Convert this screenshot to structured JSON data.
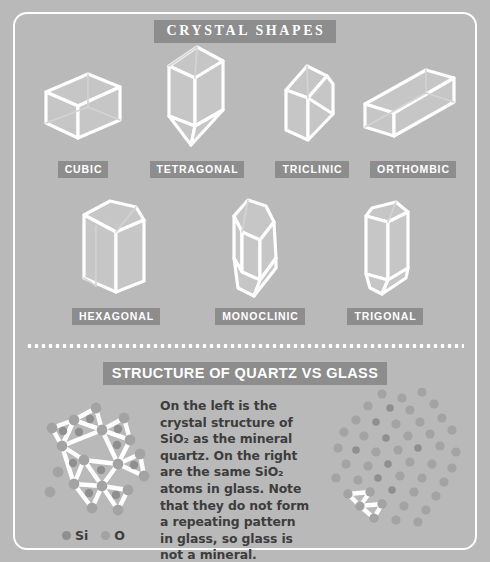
{
  "poster": {
    "background_color": "#b9b9b9",
    "badge_color": "#8d8d8d",
    "outline_color": "#ffffff",
    "text_color": "#3d3d3d"
  },
  "crystal_section": {
    "title": "CRYSTAL SHAPES",
    "shapes": [
      {
        "label": "CUBIC",
        "icon": "cubic-crystal-icon"
      },
      {
        "label": "TETRAGONAL",
        "icon": "tetragonal-crystal-icon"
      },
      {
        "label": "TRICLINIC",
        "icon": "triclinic-crystal-icon"
      },
      {
        "label": "ORTHOMBIC",
        "icon": "orthombic-crystal-icon"
      },
      {
        "label": "HEXAGONAL",
        "icon": "hexagonal-crystal-icon"
      },
      {
        "label": "MONOCLINIC",
        "icon": "monoclinic-crystal-icon"
      },
      {
        "label": "TRIGONAL",
        "icon": "trigonal-crystal-icon"
      }
    ]
  },
  "structure_section": {
    "title": "STRUCTURE OF QUARTZ VS GLASS",
    "body_text": "On the left is the crystal structure of SiO₂ as the mineral quartz. On the right are the same SiO₂ atoms in glass. Note that they do not form a repeating pattern in glass, so glass is not a mineral.",
    "left_diagram": "quartz-crystal-lattice-diagram",
    "right_diagram": "glass-amorphous-structure-diagram",
    "legend": [
      {
        "label": "Si",
        "color": "#8f8f8f"
      },
      {
        "label": "O",
        "color": "#a3a3a3"
      }
    ]
  }
}
